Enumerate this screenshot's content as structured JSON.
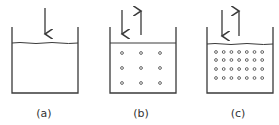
{
  "panels": [
    {
      "id": "a",
      "label": "(a)",
      "particles_rows": 0,
      "particles_cols": 0,
      "arrows": [
        "down"
      ]
    },
    {
      "id": "b",
      "label": "(b)",
      "particles_rows": 3,
      "particles_cols": 3,
      "arrows": [
        "down",
        "up"
      ]
    },
    {
      "id": "c",
      "label": "(c)",
      "particles_rows": 4,
      "particles_cols": 7,
      "arrows": [
        "down",
        "up"
      ]
    }
  ],
  "colors": {
    "line": "#3a3a3a",
    "particle": "#555555",
    "background": "#ffffff"
  }
}
